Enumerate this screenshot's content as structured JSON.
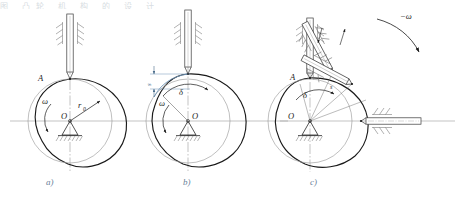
{
  "figure": {
    "background": "#ffffff",
    "ink_color": "#1a1a1a",
    "thin_color": "#8a8a8a",
    "center_line_color": "#9a9a9a",
    "accent_color": "#4a6d8c",
    "caption_color": "#6a8099",
    "top_cropped_text": "图  凸轮  机  构  的  设  计"
  },
  "subfigures": [
    {
      "id": "a",
      "caption": "a)",
      "description": "Initial position: follower knife edge at point A on base circle",
      "labels": {
        "contact_point": "A",
        "angular_velocity": "ω",
        "center": "O",
        "base_radius": "r",
        "base_radius_subscript": "0"
      },
      "elements": [
        "follower-rod-vertical",
        "guide-hatching-left",
        "guide-hatching-right",
        "cam-profile",
        "base-circle",
        "pivot-triangle",
        "ground-hatching",
        "horizontal-center-line",
        "vertical-center-line",
        "omega-arc-arrow",
        "base-radius-arrow"
      ]
    },
    {
      "id": "b",
      "caption": "b)",
      "description": "Cam rotated by angle delta; follower displaced upward by s",
      "labels": {
        "displacement": "s",
        "cam_angle": "δ",
        "angular_velocity": "ω",
        "center": "O"
      },
      "elements": [
        "follower-rod-vertical",
        "guide-hatching-left",
        "guide-hatching-right",
        "cam-profile",
        "base-circle",
        "pivot-triangle",
        "ground-hatching",
        "horizontal-center-line",
        "vertical-center-line",
        "displacement-dimension",
        "delta-arc-arrow",
        "omega-arc-arrow",
        "blue-profile-arc"
      ]
    },
    {
      "id": "c",
      "caption": "c)",
      "description": "Inverted motion: follower drawn at successive angular positions around fixed cam",
      "labels": {
        "contact_point": "A",
        "cam_angle": "δ",
        "displacement": "s",
        "reverse_angular_velocity": "−ω",
        "center": "O"
      },
      "elements": [
        "follower-position-vertical",
        "follower-position-steep",
        "follower-position-diagonal",
        "follower-position-horizontal",
        "guide-hatching-vertical",
        "guide-hatching-steep",
        "guide-hatching-diagonal",
        "guide-hatching-horizontal",
        "cam-profile",
        "base-circle",
        "pivot-triangle",
        "ground-hatching",
        "horizontal-center-line",
        "vertical-center-line",
        "reverse-omega-arc-arrow",
        "delta-arc-arrow",
        "radial-construction-lines",
        "up-down-motion-arrows"
      ]
    }
  ]
}
